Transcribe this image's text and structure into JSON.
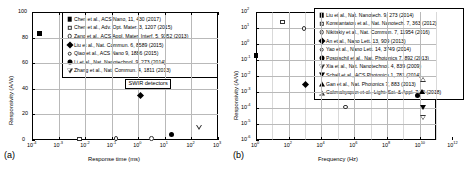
{
  "figure": {
    "panel_a_tag": "(a)",
    "panel_b_tag": "(b)"
  },
  "chart_data": [
    {
      "panel": "(a)",
      "type": "scatter",
      "title": "",
      "xlabel": "Response time (ms)",
      "ylabel": "Responsivity (A/W)",
      "xscale": "log",
      "yscale": "linear",
      "xlim": [
        0.0001,
        1000
      ],
      "ylim": [
        0,
        100
      ],
      "grid": true,
      "xticklabels": [
        "10-4",
        "10-3",
        "10-2",
        "10-1",
        "100",
        "101",
        "102",
        "103"
      ],
      "yticklabels": [
        "0",
        "20",
        "40",
        "60",
        "80",
        "100"
      ],
      "annotation": "SWIR detectors",
      "legend_position": "upper-center",
      "series": [
        {
          "name": "Chen et al., ACS Nano, 11, 430 (2017)",
          "marker": "filled-square",
          "x": 0.0002,
          "y": 83
        },
        {
          "name": "Chen et al., Adv. Opt. Mater. 3, 1207 (2015)",
          "marker": "open-square",
          "x": 0.006,
          "y": 1
        },
        {
          "name": "Zang et al., ACS Appl. Mater. Interf. 5, 9352 (2013)",
          "marker": "open-circle",
          "x": 0.15,
          "y": 1
        },
        {
          "name": "Liu et al., Nat. Commun. 6, 8589 (2015)",
          "marker": "filled-diamond",
          "x": 1.2,
          "y": 35
        },
        {
          "name": "Qiao et al., ACS Nano 9, 1886 (2015)",
          "marker": "open-circle",
          "x": 3.2,
          "y": 1
        },
        {
          "name": "Li et al., Nat. Nanotechnol. 9, 273 (2014)",
          "marker": "filled-circle",
          "x": 18,
          "y": 4.5
        },
        {
          "name": "Zhang et al., Nat. Commun. 4, 1811 (2013)",
          "marker": "open-down-triangle",
          "x": 200,
          "y": 10
        }
      ]
    },
    {
      "panel": "(b)",
      "type": "scatter",
      "title": "",
      "xlabel": "Frequency (Hz)",
      "ylabel": "Responsivity (A/W)",
      "xscale": "log",
      "yscale": "log",
      "xlim": [
        1,
        100000000000
      ],
      "ylim": [
        1e-06,
        100
      ],
      "grid": true,
      "xticklabels": [
        "100",
        "102",
        "104",
        "106",
        "108",
        "1010",
        "1012"
      ],
      "yticklabels": [
        "102",
        "101",
        "100",
        "10-1",
        "10-2",
        "10-3",
        "10-4",
        "10-5",
        "10-6"
      ],
      "legend_position": "upper-right",
      "series": [
        {
          "name": "Liu et al., Nat. Nanotech. 9, 273 (2014)",
          "marker": "filled-square",
          "x": 1,
          "y": 0.18
        },
        {
          "name": "Konstantatos et al., Nat. Nanotech. 7, 363 (2012)",
          "marker": "open-square",
          "x": 40,
          "y": 25
        },
        {
          "name": "Nikitskiy et al., Nat. Commun. 7, 11954 (2016)",
          "marker": "open-circle",
          "x": 900,
          "y": 9
        },
        {
          "name": "An et al., Nano Lett. 13, 909 (2013)",
          "marker": "filled-diamond",
          "x": 1100,
          "y": 0.0028
        },
        {
          "name": "Yao et al., Nano Lett. 14, 3749 (2014)",
          "marker": "open-circle",
          "x": 300000,
          "y": 0.00011
        },
        {
          "name": "Pospischil et al., Nat. Photonics 7, 892 (2013)",
          "marker": "filled-circle",
          "x": 7000000000,
          "y": 0.0006
        },
        {
          "name": "Xia et al., Nat. Nanotechnol. 4, 839 (2009)",
          "marker": "open-down-triangle",
          "x": 17000000000,
          "y": 2.4e-05
        },
        {
          "name": "Schall et al., ACS Photonics 1, 781 (2014)",
          "marker": "filled-down-triangle",
          "x": 17000000000,
          "y": 0.00011
        },
        {
          "name": "Gan et al., Nat. Photonics 7, 883 (2013)",
          "marker": "filled-up-triangle",
          "x": 13000000000,
          "y": 0.0011
        },
        {
          "name": "Cakmakyapan et al., Light: Sci. & Appl. 7:20 (2018)",
          "marker": "open-up-triangle",
          "x": 17000000000,
          "y": 0.006
        }
      ]
    }
  ]
}
